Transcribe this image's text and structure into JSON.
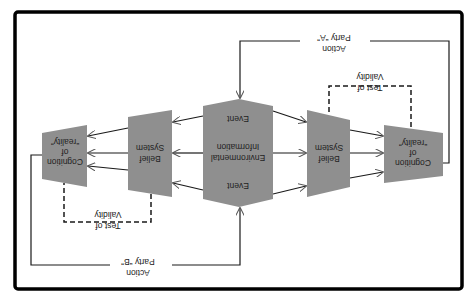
{
  "diagram": {
    "orientation": "rotated-180",
    "colors": {
      "shape_fill": "#8f8f8f",
      "line": "#1a1a1a",
      "frame": "#000000",
      "background": "#ffffff"
    },
    "nodes": {
      "environment": {
        "line1": "Event",
        "line2a": "Environmental",
        "line2b": "Information",
        "line3": "Event"
      },
      "belief_left": {
        "line1": "Belief",
        "line2": "System"
      },
      "belief_right": {
        "line1": "Belief",
        "line2": "System"
      },
      "cognition_left": {
        "line1": "Cognition",
        "line2": "of",
        "line3": "“reality”"
      },
      "cognition_right": {
        "line1": "Cognition",
        "line2": "of",
        "line3": "“reality”"
      }
    },
    "loops": {
      "action_a": {
        "line1": "Action",
        "line2": "Party “A”"
      },
      "action_b": {
        "line1": "Action",
        "line2": "Party “B”"
      },
      "validity_right": {
        "line1": "Test of",
        "line2": "Validity"
      },
      "validity_left": {
        "line1": "Test of",
        "line2": "Validity"
      }
    }
  }
}
